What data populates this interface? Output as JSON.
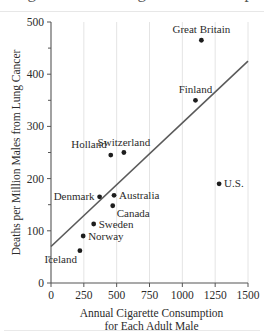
{
  "figure": {
    "partial_title_above": "Lung Cancer and Cigarette Consumption",
    "background": "#ffffff",
    "line_color": "#5a5a5a",
    "dot_color": "#1d1d1d",
    "grid_color": "#e4e4e4"
  },
  "chart_data": {
    "type": "scatter",
    "title": "",
    "xlabel_line1": "Annual Cigarette Consumption",
    "xlabel_line2": "for Each Adult Male",
    "ylabel": "Deaths per Million Males from Lung Cancer",
    "xlim": [
      0,
      1500
    ],
    "ylim": [
      0,
      500
    ],
    "xticks": [
      0,
      250,
      500,
      750,
      1000,
      1250,
      1500
    ],
    "yticks": [
      0,
      100,
      200,
      300,
      400,
      500
    ],
    "xtick_labels": [
      "0",
      "250",
      "500",
      "750",
      "1000",
      "1250",
      "1500"
    ],
    "ytick_labels": [
      "0",
      "100",
      "200",
      "300",
      "400",
      "500"
    ],
    "grid": "vertical-faint",
    "legend": "none",
    "points": [
      {
        "label": "Great Britain",
        "x": 1145,
        "y": 465,
        "label_pos": "above"
      },
      {
        "label": "Finland",
        "x": 1100,
        "y": 350,
        "label_pos": "above"
      },
      {
        "label": "U.S.",
        "x": 1280,
        "y": 190,
        "label_pos": "right"
      },
      {
        "label": "Switzerland",
        "x": 555,
        "y": 250,
        "label_pos": "above"
      },
      {
        "label": "Holland",
        "x": 455,
        "y": 245,
        "label_pos": "above-left"
      },
      {
        "label": "Australia",
        "x": 480,
        "y": 168,
        "label_pos": "right"
      },
      {
        "label": "Denmark",
        "x": 370,
        "y": 165,
        "label_pos": "left"
      },
      {
        "label": "Canada",
        "x": 470,
        "y": 148,
        "label_pos": "below-right"
      },
      {
        "label": "Sweden",
        "x": 325,
        "y": 113,
        "label_pos": "right"
      },
      {
        "label": "Norway",
        "x": 245,
        "y": 90,
        "label_pos": "right"
      },
      {
        "label": "Iceland",
        "x": 220,
        "y": 62,
        "label_pos": "below-left"
      }
    ],
    "trend_line": {
      "x_start": 0,
      "y_start": 70,
      "x_end": 1500,
      "y_end": 425
    }
  }
}
